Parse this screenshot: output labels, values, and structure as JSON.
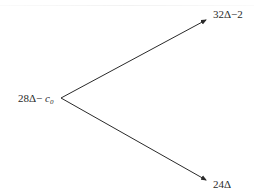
{
  "diagram": {
    "type": "binomial-tree",
    "origin": {
      "prefix": "28Δ− ",
      "variable": "c",
      "subscript": "0"
    },
    "branches": [
      {
        "name": "up",
        "label": "32Δ−2"
      },
      {
        "name": "down",
        "label": "24Δ"
      }
    ],
    "colors": {
      "line": "#2a2a2a",
      "text": "#2a2a2a",
      "background": "#ffffff"
    }
  }
}
